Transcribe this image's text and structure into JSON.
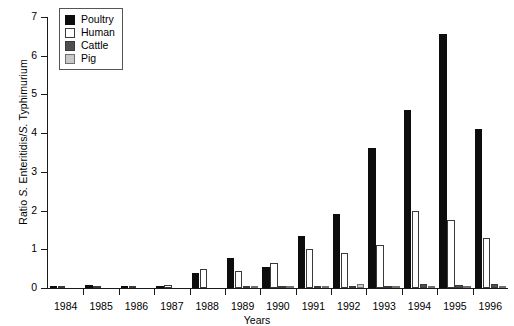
{
  "chart_data": {
    "type": "bar",
    "title": "",
    "xlabel": "Years",
    "ylabel": "Ratio S. Enteritidis/S. Typhimurium",
    "ylabel_parts": {
      "prefix": "Ratio ",
      "italic1": "S.",
      "mid": " Enteritidis/",
      "italic2": "S.",
      "suffix": " Typhimurium"
    },
    "categories": [
      "1984",
      "1985",
      "1986",
      "1987",
      "1988",
      "1989",
      "1990",
      "1991",
      "1992",
      "1993",
      "1994",
      "1995",
      "1996"
    ],
    "series": [
      {
        "name": "Poultry",
        "color": "#0d0d0d",
        "values": [
          0.02,
          0.08,
          0.03,
          0.04,
          0.4,
          0.78,
          0.55,
          1.35,
          1.9,
          3.62,
          4.6,
          6.55,
          4.1
        ]
      },
      {
        "name": "Human",
        "color": "#ffffff",
        "values": [
          0.06,
          0.06,
          0.05,
          0.07,
          0.5,
          0.45,
          0.65,
          1.0,
          0.9,
          1.1,
          2.0,
          1.75,
          1.3
        ]
      },
      {
        "name": "Cattle",
        "color": "#4f4f4f",
        "values": [
          0.0,
          0.0,
          0.0,
          0.0,
          0.0,
          0.05,
          0.04,
          0.05,
          0.06,
          0.05,
          0.1,
          0.08,
          0.1
        ]
      },
      {
        "name": "Pig",
        "color": "#c8c8c8",
        "values": [
          0.0,
          0.0,
          0.0,
          0.0,
          0.0,
          0.02,
          0.02,
          0.03,
          0.1,
          0.05,
          0.06,
          0.05,
          0.05
        ]
      }
    ],
    "ylim": [
      0,
      7
    ],
    "yticks": [
      "0",
      "1",
      "2",
      "3",
      "4",
      "5",
      "6",
      "7"
    ],
    "grid": false,
    "legend_position": "top-left"
  },
  "legend": {
    "items": [
      {
        "label": "Poultry",
        "swatch": "poultry-swatch"
      },
      {
        "label": "Human",
        "swatch": "human-swatch"
      },
      {
        "label": "Cattle",
        "swatch": "cattle-swatch"
      },
      {
        "label": "Pig",
        "swatch": "pig-swatch"
      }
    ]
  }
}
